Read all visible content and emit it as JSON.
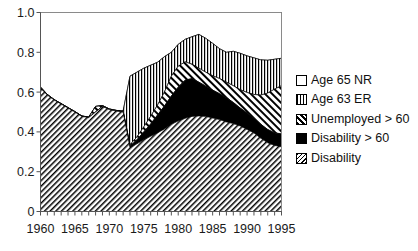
{
  "chart_data": {
    "type": "area",
    "stacked": true,
    "title": "",
    "xlabel": "",
    "ylabel": "",
    "xlim": [
      1960,
      1995
    ],
    "ylim": [
      0,
      1.0
    ],
    "grid": false,
    "legend_position": "right",
    "x": [
      1960,
      1961,
      1962,
      1963,
      1964,
      1965,
      1966,
      1967,
      1968,
      1969,
      1970,
      1971,
      1972,
      1973,
      1974,
      1975,
      1976,
      1977,
      1978,
      1979,
      1980,
      1981,
      1982,
      1983,
      1984,
      1985,
      1986,
      1987,
      1988,
      1989,
      1990,
      1991,
      1992,
      1993,
      1994,
      1995
    ],
    "xticks": [
      1960,
      1965,
      1970,
      1975,
      1980,
      1985,
      1990,
      1995
    ],
    "xticklabels": [
      "1960",
      "1965",
      "1970",
      "1975",
      "1980",
      "1985",
      "1990",
      "1995"
    ],
    "yticks": [
      0,
      0.2,
      0.4,
      0.6,
      0.8,
      1.0
    ],
    "yticklabels": [
      "0",
      "0.2",
      "0.4",
      "0.6",
      "0.8",
      "1.0"
    ],
    "series": [
      {
        "name": "Disability",
        "pattern": "diagonal-hatch",
        "cumulative": [
          0.62,
          0.585,
          0.56,
          0.54,
          0.52,
          0.5,
          0.478,
          0.472,
          0.5,
          0.528,
          0.512,
          0.505,
          0.5,
          0.32,
          0.34,
          0.36,
          0.378,
          0.395,
          0.415,
          0.438,
          0.455,
          0.468,
          0.478,
          0.48,
          0.478,
          0.47,
          0.462,
          0.45,
          0.442,
          0.43,
          0.412,
          0.395,
          0.368,
          0.345,
          0.332,
          0.325
        ]
      },
      {
        "name": "Disability > 60",
        "pattern": "solid-black",
        "cumulative": [
          0.62,
          0.585,
          0.56,
          0.54,
          0.52,
          0.5,
          0.478,
          0.472,
          0.5,
          0.528,
          0.512,
          0.505,
          0.5,
          0.328,
          0.36,
          0.4,
          0.44,
          0.485,
          0.53,
          0.58,
          0.625,
          0.66,
          0.668,
          0.65,
          0.63,
          0.61,
          0.592,
          0.572,
          0.548,
          0.52,
          0.495,
          0.468,
          0.438,
          0.412,
          0.395,
          0.39
        ]
      },
      {
        "name": "Unemployed > 60",
        "pattern": "wide-diagonal-hatch",
        "cumulative": [
          0.625,
          0.588,
          0.562,
          0.542,
          0.522,
          0.502,
          0.48,
          0.474,
          0.528,
          0.532,
          0.515,
          0.508,
          0.505,
          0.335,
          0.375,
          0.425,
          0.478,
          0.535,
          0.6,
          0.68,
          0.73,
          0.752,
          0.74,
          0.72,
          0.7,
          0.682,
          0.668,
          0.65,
          0.632,
          0.612,
          0.598,
          0.588,
          0.585,
          0.595,
          0.615,
          0.632
        ]
      },
      {
        "name": "Age 63 ER",
        "pattern": "vertical-lines",
        "cumulative": [
          0.625,
          0.588,
          0.562,
          0.542,
          0.522,
          0.502,
          0.48,
          0.474,
          0.528,
          0.532,
          0.515,
          0.508,
          0.505,
          0.68,
          0.7,
          0.72,
          0.735,
          0.75,
          0.778,
          0.8,
          0.84,
          0.865,
          0.878,
          0.89,
          0.87,
          0.845,
          0.818,
          0.8,
          0.805,
          0.795,
          0.782,
          0.772,
          0.762,
          0.76,
          0.765,
          0.77
        ]
      },
      {
        "name": "Age 65 NR",
        "pattern": "empty-white",
        "cumulative": [
          1.0,
          1.0,
          1.0,
          1.0,
          1.0,
          1.0,
          1.0,
          1.0,
          1.0,
          1.0,
          1.0,
          1.0,
          1.0,
          1.0,
          1.0,
          1.0,
          1.0,
          1.0,
          1.0,
          1.0,
          1.0,
          1.0,
          1.0,
          1.0,
          1.0,
          1.0,
          1.0,
          1.0,
          1.0,
          1.0,
          1.0,
          1.0,
          1.0,
          1.0,
          1.0,
          1.0
        ]
      }
    ]
  },
  "legend": {
    "items": [
      {
        "label": "Age 65 NR",
        "swatch": "empty-white"
      },
      {
        "label": "Age 63 ER",
        "swatch": "vertical-lines"
      },
      {
        "label": "Unemployed > 60",
        "swatch": "wide-diagonal-hatch"
      },
      {
        "label": "Disability > 60",
        "swatch": "solid-black"
      },
      {
        "label": "Disability",
        "swatch": "diagonal-hatch"
      }
    ]
  }
}
